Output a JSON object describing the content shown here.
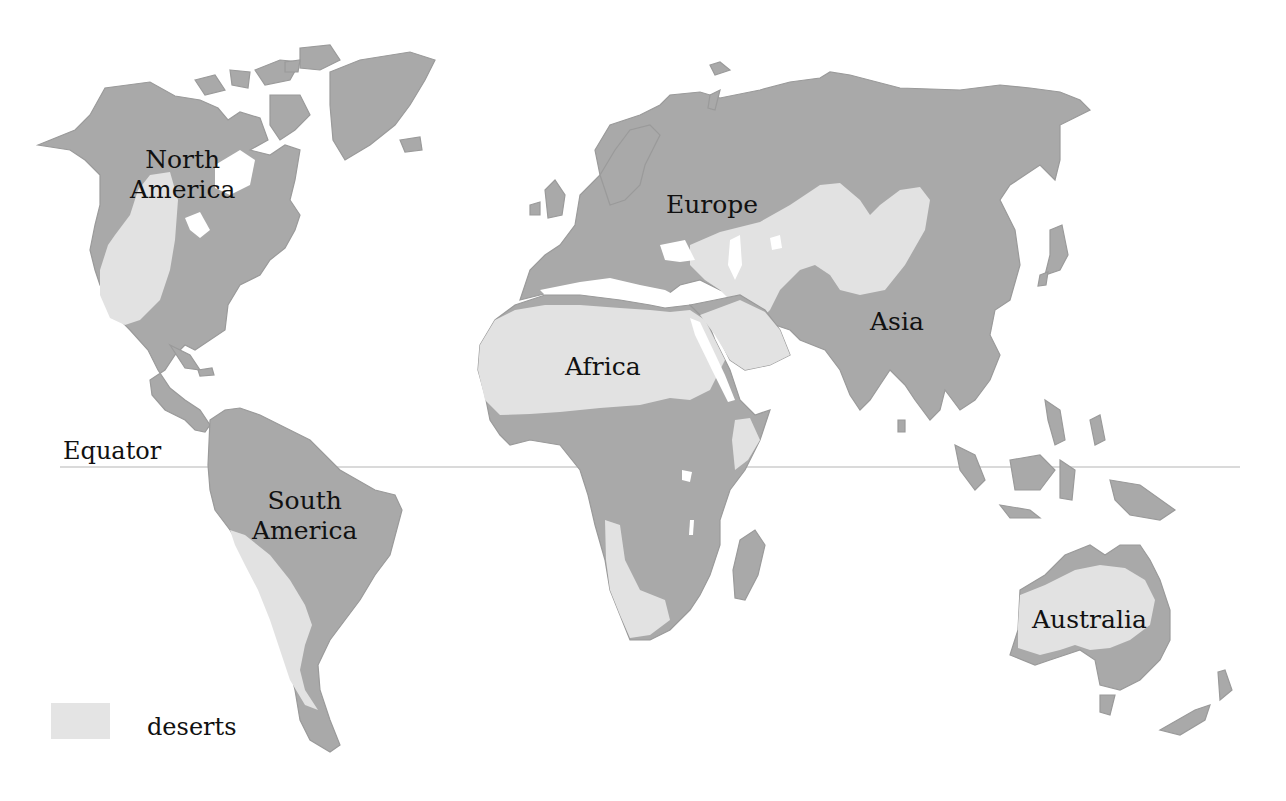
{
  "map": {
    "type": "world-desert-map",
    "colors": {
      "land": "#a9a9a9",
      "desert": "#e2e2e2",
      "water": "#ffffff",
      "equator": "#b5b5b5"
    },
    "continents": [
      {
        "id": "north-america",
        "label_line1": "North",
        "label_line2": "America"
      },
      {
        "id": "south-america",
        "label_line1": "South",
        "label_line2": "America"
      },
      {
        "id": "europe",
        "label": "Europe"
      },
      {
        "id": "asia",
        "label": "Asia"
      },
      {
        "id": "africa",
        "label": "Africa"
      },
      {
        "id": "australia",
        "label": "Australia"
      }
    ],
    "equator_label": "Equator",
    "legend": {
      "swatch_color": "#e4e4e4",
      "label": "deserts"
    }
  }
}
